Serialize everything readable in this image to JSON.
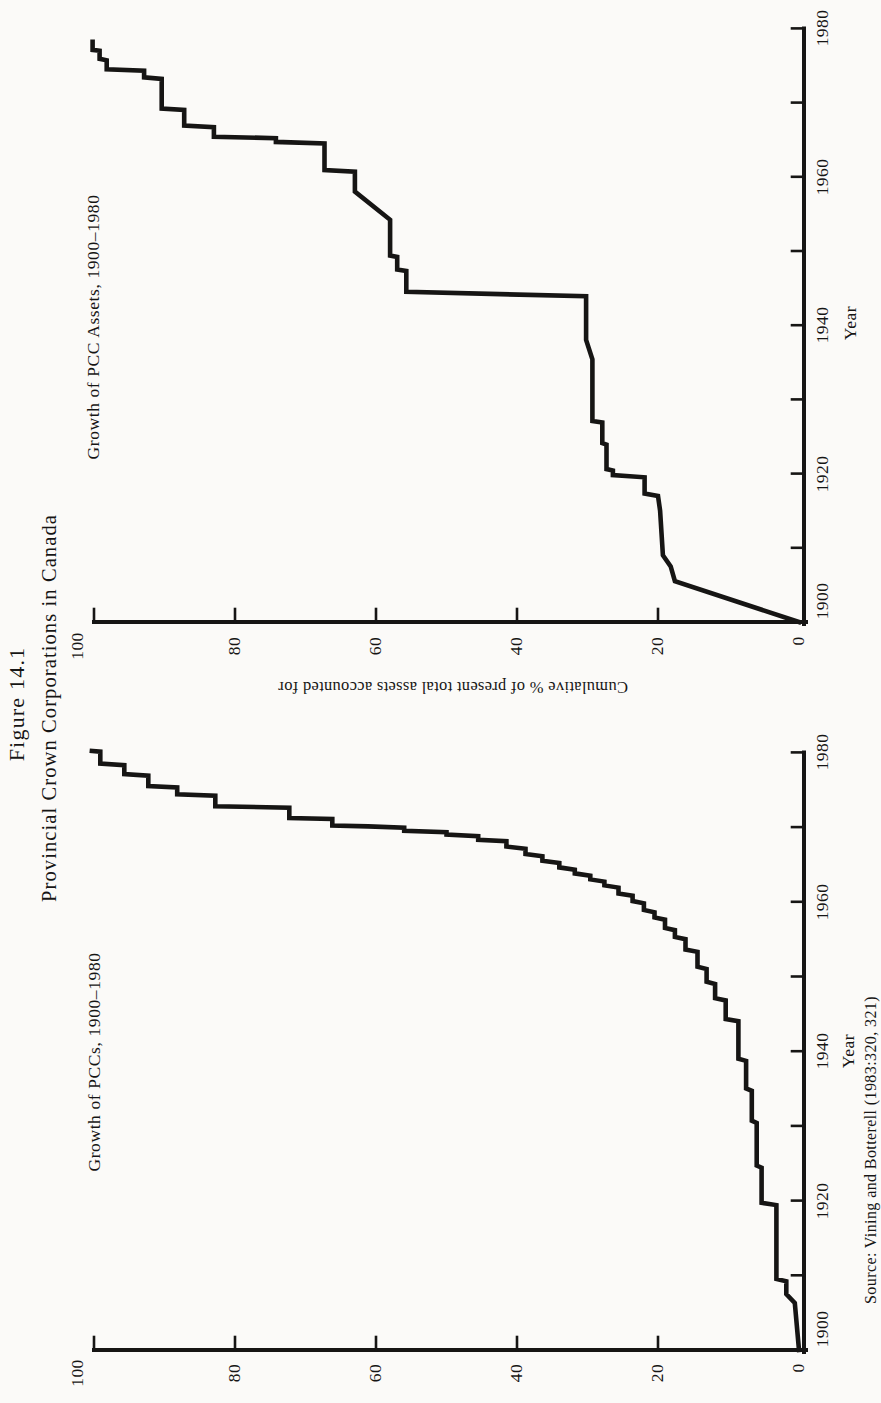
{
  "page": {
    "background": "#fbfaf8",
    "ink": "#161514"
  },
  "figure_title": {
    "line1": "Figure 14.1",
    "line2": "Provincial Crown Corporations in Canada"
  },
  "source_note": "Source: Vining and Botterell (1983:320, 321)",
  "shared_axis": {
    "x_title": "Year",
    "y_title": "Cumulative % of present total assets accounted for",
    "year_tick_labels": [
      "1900",
      "1920",
      "1940",
      "1960",
      "1980"
    ],
    "pct_tick_labels": [
      "100",
      "80",
      "60",
      "40",
      "20",
      "0"
    ],
    "x_range": [
      1900,
      1980
    ],
    "y_range": [
      0,
      100
    ]
  },
  "chart_data": [
    {
      "id": "pcc-assets",
      "type": "line",
      "subtype": "cumulative-step-curve",
      "title": "Growth of PCC Assets, 1900–1980",
      "xlabel": "Year",
      "ylabel": "Cumulative % of present total assets accounted for",
      "xlim": [
        1900,
        1980
      ],
      "ylim": [
        0,
        100
      ],
      "grid": false,
      "points": [
        [
          1900,
          0
        ],
        [
          1905.5,
          17.6
        ],
        [
          1907.5,
          18.2
        ],
        [
          1909,
          19.3
        ],
        [
          1915,
          19.7
        ],
        [
          1917,
          20
        ],
        [
          1917.3,
          21.9
        ],
        [
          1919.5,
          21.9
        ],
        [
          1919.8,
          26.4
        ],
        [
          1920.4,
          26.4
        ],
        [
          1920.6,
          27.3
        ],
        [
          1923.9,
          27.3
        ],
        [
          1924.1,
          27.9
        ],
        [
          1926.9,
          27.9
        ],
        [
          1927.1,
          29.3
        ],
        [
          1935.4,
          29.3
        ],
        [
          1938,
          30.2
        ],
        [
          1943.9,
          30.2
        ],
        [
          1944.5,
          55.7
        ],
        [
          1947.3,
          55.7
        ],
        [
          1947.5,
          57
        ],
        [
          1949.2,
          57
        ],
        [
          1949.4,
          58
        ],
        [
          1954.2,
          58
        ],
        [
          1958,
          63
        ],
        [
          1960.7,
          63
        ],
        [
          1960.9,
          67.3
        ],
        [
          1964.5,
          67.3
        ],
        [
          1964.7,
          74.2
        ],
        [
          1965.2,
          74.2
        ],
        [
          1965.4,
          83
        ],
        [
          1966.7,
          83
        ],
        [
          1966.9,
          87.2
        ],
        [
          1969,
          87.2
        ],
        [
          1969.2,
          90.4
        ],
        [
          1973.2,
          90.4
        ],
        [
          1973.4,
          92.9
        ],
        [
          1974.3,
          92.9
        ],
        [
          1974.5,
          98.2
        ],
        [
          1975.7,
          98.2
        ],
        [
          1975.9,
          99.2
        ],
        [
          1977,
          99.2
        ],
        [
          1977.1,
          100.2
        ],
        [
          1978.2,
          100.2
        ]
      ]
    },
    {
      "id": "pccs",
      "type": "line",
      "subtype": "cumulative-step-curve",
      "title": "Growth of PCCs, 1900–1980",
      "xlabel": "Year",
      "ylabel": "Cumulative % of present total assets accounted for",
      "xlim": [
        1900,
        1980
      ],
      "ylim": [
        0,
        100
      ],
      "grid": false,
      "points": [
        [
          1900,
          0
        ],
        [
          1906.3,
          0.6
        ],
        [
          1907.5,
          1.8
        ],
        [
          1909.2,
          1.8
        ],
        [
          1909.5,
          3.2
        ],
        [
          1919.4,
          3.2
        ],
        [
          1919.7,
          5.3
        ],
        [
          1924.4,
          5.3
        ],
        [
          1924.7,
          6
        ],
        [
          1930.4,
          6
        ],
        [
          1930.7,
          6.7
        ],
        [
          1934.7,
          6.7
        ],
        [
          1935,
          7.5
        ],
        [
          1938.7,
          7.5
        ],
        [
          1939,
          8.6
        ],
        [
          1944,
          8.6
        ],
        [
          1944.3,
          10.4
        ],
        [
          1946.8,
          10.4
        ],
        [
          1947.1,
          11.9
        ],
        [
          1949,
          11.9
        ],
        [
          1949.3,
          13.1
        ],
        [
          1951,
          13.1
        ],
        [
          1951.3,
          14.4
        ],
        [
          1953.3,
          14.4
        ],
        [
          1953.6,
          16.1
        ],
        [
          1955,
          16.1
        ],
        [
          1955.3,
          17.6
        ],
        [
          1956.2,
          17.6
        ],
        [
          1956.5,
          19
        ],
        [
          1957.6,
          19
        ],
        [
          1957.9,
          20.5
        ],
        [
          1958.6,
          20.5
        ],
        [
          1958.9,
          22
        ],
        [
          1959.8,
          22
        ],
        [
          1960.1,
          23.6
        ],
        [
          1960.8,
          23.6
        ],
        [
          1961.1,
          25.6
        ],
        [
          1961.9,
          25.6
        ],
        [
          1962.2,
          27.6
        ],
        [
          1962.7,
          27.6
        ],
        [
          1963,
          29.6
        ],
        [
          1963.5,
          29.6
        ],
        [
          1963.8,
          31.8
        ],
        [
          1964.3,
          31.8
        ],
        [
          1964.6,
          34
        ],
        [
          1965.2,
          34
        ],
        [
          1965.5,
          36.4
        ],
        [
          1966.1,
          36.4
        ],
        [
          1966.4,
          38.8
        ],
        [
          1967.1,
          38.8
        ],
        [
          1967.4,
          41.5
        ],
        [
          1968.1,
          41.5
        ],
        [
          1968.3,
          45.5
        ],
        [
          1968.8,
          45.5
        ],
        [
          1969,
          50
        ],
        [
          1969.3,
          50
        ],
        [
          1969.5,
          56
        ],
        [
          1969.9,
          56
        ],
        [
          1970.1,
          61.1
        ],
        [
          1970.2,
          66.2
        ],
        [
          1971.1,
          66.2
        ],
        [
          1971.2,
          72.3
        ],
        [
          1972.6,
          72.3
        ],
        [
          1972.8,
          82.8
        ],
        [
          1974.2,
          82.8
        ],
        [
          1974.4,
          88.2
        ],
        [
          1975.3,
          88.2
        ],
        [
          1975.5,
          92.3
        ],
        [
          1976.9,
          92.3
        ],
        [
          1977.1,
          95.7
        ],
        [
          1978.3,
          95.7
        ],
        [
          1978.5,
          99.1
        ],
        [
          1980.1,
          99.1
        ],
        [
          1980.2,
          100.3
        ]
      ]
    }
  ]
}
